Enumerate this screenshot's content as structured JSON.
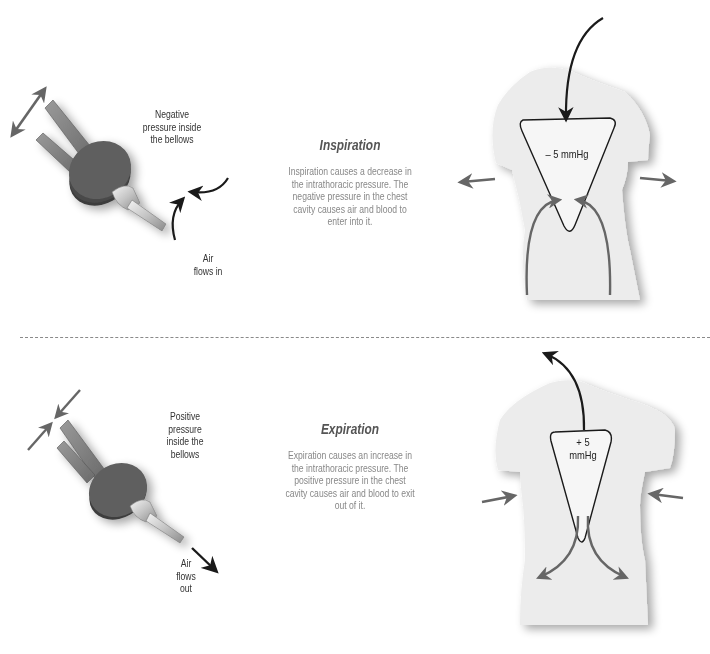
{
  "inspiration": {
    "title": "Inspiration",
    "description": "Inspiration causes a decrease in the intrathoracic pressure. The negative pressure in the chest cavity causes air and blood to enter into it.",
    "bellows_label": "Negative pressure inside the bellows",
    "air_label": "Air flows in",
    "pressure_label": "– 5 mmHg"
  },
  "expiration": {
    "title": "Expiration",
    "description": "Expiration causes an increase in the intrathoracic pressure. The positive pressure in the chest cavity causes air and blood to exit out of it.",
    "bellows_label": "Positive pressure inside the bellows",
    "air_label": "Air flows out",
    "pressure_label": "+ 5 mmHg"
  },
  "colors": {
    "torso": "#ececec",
    "bellows_body": "#5f5f5f",
    "arrow_dark": "#1a1a1a",
    "arrow_gray": "#666666"
  }
}
